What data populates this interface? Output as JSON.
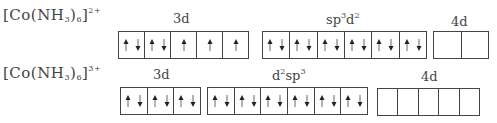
{
  "rows": [
    {
      "formula": {
        "prefix": "[Co(NH",
        "sub": "3",
        "mid": ")",
        "sub2": "6",
        "suffix": "]",
        "charge": "2+"
      },
      "groups": [
        {
          "label": "3d",
          "label_sup": [],
          "cells": [
            "ud",
            "ud",
            "u",
            "u",
            "u"
          ]
        },
        {
          "label": "sp3d2",
          "label_parts": [
            "sp",
            "3",
            "d",
            "2"
          ],
          "cells": [
            "ud",
            "ud",
            "ud",
            "ud",
            "ud",
            "ud"
          ]
        },
        {
          "label": "4d",
          "label_sup": [],
          "cells": [
            "",
            ""
          ]
        }
      ]
    },
    {
      "formula": {
        "prefix": "[Co(NH",
        "sub": "3",
        "mid": ")",
        "sub2": "6",
        "suffix": "]",
        "charge": "3+"
      },
      "groups": [
        {
          "label": "3d",
          "label_sup": [],
          "cells": [
            "ud",
            "ud",
            "ud"
          ]
        },
        {
          "label": "d2sp3",
          "label_parts": [
            "d",
            "2",
            "sp",
            "3"
          ],
          "cells": [
            "ud",
            "ud",
            "ud",
            "ud",
            "ud",
            "ud"
          ]
        },
        {
          "label": "4d",
          "label_sup": [],
          "cells": [
            "",
            "",
            "",
            "",
            ""
          ]
        }
      ]
    }
  ],
  "text": {
    "r1_prefix": "[Co(NH",
    "r1_sub": "3",
    "r1_mid": ")",
    "r1_sub2": "6",
    "r1_suffix": "]",
    "r1_charge": "2+",
    "r2_charge": "3+",
    "lbl_3d": "3d",
    "lbl_4d": "4d",
    "sp": "sp",
    "d": "d",
    "three": "3",
    "two": "2"
  }
}
